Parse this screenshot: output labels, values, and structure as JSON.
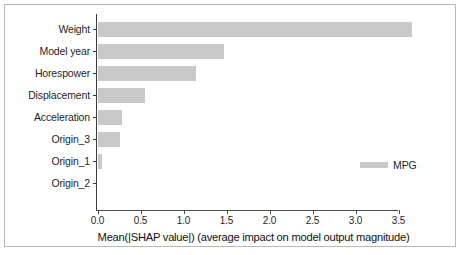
{
  "chart_data": {
    "type": "bar",
    "orientation": "horizontal",
    "title": "",
    "xlabel": "Mean(|SHAP value|) (average impact on model output magnitude)",
    "ylabel": "",
    "categories": [
      "Weight",
      "Model year",
      "Horespower",
      "Displacement",
      "Acceleration",
      "Origin_3",
      "Origin_1",
      "Origin_2"
    ],
    "values": [
      3.66,
      1.47,
      1.14,
      0.55,
      0.28,
      0.26,
      0.05,
      0.0
    ],
    "series": [
      {
        "name": "MPG",
        "values": [
          3.66,
          1.47,
          1.14,
          0.55,
          0.28,
          0.26,
          0.05,
          0.0
        ],
        "color": "#c9c9c9"
      }
    ],
    "xlim": [
      0.0,
      3.78
    ],
    "xticks": [
      0.0,
      0.5,
      1.0,
      1.5,
      2.0,
      2.5,
      3.0,
      3.5
    ],
    "xtick_labels": [
      "0.0",
      "0.5",
      "1.0",
      "1.5",
      "2.0",
      "2.5",
      "3.0",
      "3.5"
    ],
    "grid": false,
    "legend": {
      "position": "center-right",
      "entries": [
        {
          "label": "MPG",
          "color": "#c9c9c9"
        }
      ]
    },
    "bar_color": "#c9c9c9",
    "axis_color": "#3b3b3b",
    "background": "#ffffff"
  }
}
